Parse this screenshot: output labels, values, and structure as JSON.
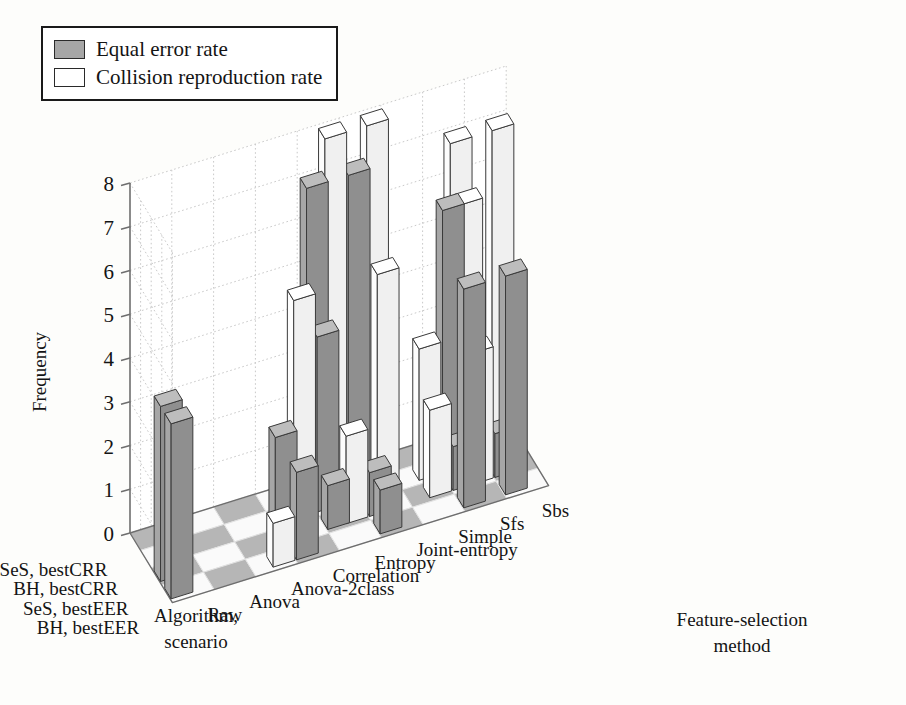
{
  "legend": {
    "position": "top-left",
    "items": [
      {
        "label": "Equal error rate",
        "color": "#a6a6a6",
        "key": "eer"
      },
      {
        "label": "Collision reproduction rate",
        "color": "#ffffff",
        "key": "crr"
      }
    ]
  },
  "axes": {
    "z": {
      "label": "Frequency",
      "ticks": [
        "0",
        "1",
        "2",
        "3",
        "4",
        "5",
        "6",
        "7",
        "8"
      ],
      "range": [
        0,
        8
      ]
    },
    "x": {
      "label_line1": "Algorithm,",
      "label_line2": "scenario",
      "categories": [
        "SeS, bestCRR",
        "BH, bestCRR",
        "SeS, bestEER",
        "BH, bestEER"
      ]
    },
    "y": {
      "label_line1": "Feature-selection",
      "label_line2": "method",
      "categories": [
        "Raw",
        "Anova",
        "Anova-2class",
        "Correlation",
        "Entropy",
        "Joint-entropy",
        "Simple",
        "Sfs",
        "Sbs"
      ]
    }
  },
  "colors": {
    "eer_top": "#bdbdbd",
    "eer_front": "#a6a6a6",
    "eer_side": "#8f8f8f",
    "crr_top": "#ffffff",
    "crr_front": "#fdfdfd",
    "crr_side": "#f0f0f0",
    "edge": "#3a3a3a",
    "grid": "#c9c9c9",
    "axis": "#6e6e6e",
    "floor_shaded": "#b6b6b6",
    "floor_plain": "#fafafa"
  },
  "chart_data": {
    "type": "bar",
    "title": "",
    "xlabel": "Algorithm, scenario",
    "ylabel": "Feature-selection method",
    "zlabel": "Frequency",
    "zlim": [
      0,
      8
    ],
    "grid": true,
    "projection": "3d-grouped-bars",
    "categories_x": [
      "SeS, bestCRR",
      "BH, bestCRR",
      "SeS, bestEER",
      "BH, bestEER"
    ],
    "categories_y": [
      "Raw",
      "Anova",
      "Anova-2class",
      "Correlation",
      "Entropy",
      "Joint-entropy",
      "Simple",
      "Sfs",
      "Sbs"
    ],
    "series": [
      {
        "name": "Equal error rate",
        "key": "eer",
        "color": "#a6a6a6",
        "values_by_scenario": {
          "SeS, bestCRR": [
            0,
            0,
            0,
            0,
            7,
            7,
            0,
            0,
            0
          ],
          "BH, bestCRR": [
            0,
            0,
            0,
            2,
            4,
            0,
            0,
            6,
            0
          ],
          "SeS, bestEER": [
            4,
            0,
            0,
            0,
            1,
            1,
            0,
            1,
            1
          ],
          "BH, bestEER": [
            4,
            0,
            0,
            2,
            0,
            1,
            0,
            5,
            5
          ]
        }
      },
      {
        "name": "Collision reproduction rate",
        "key": "crr",
        "color": "#ffffff",
        "values_by_scenario": {
          "SeS, bestCRR": [
            0,
            0,
            0,
            0,
            8,
            8,
            0,
            7,
            7
          ],
          "BH, bestCRR": [
            0,
            0,
            0,
            5,
            0,
            5,
            3,
            6,
            0
          ],
          "SeS, bestEER": [
            0,
            0,
            0,
            0,
            2,
            0,
            2,
            3,
            0
          ],
          "BH, bestEER": [
            0,
            0,
            1,
            0,
            0,
            0,
            0,
            0,
            0
          ]
        }
      }
    ]
  }
}
